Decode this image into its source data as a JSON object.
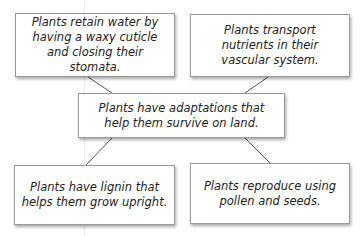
{
  "diagram": {
    "center": {
      "text": "Plants have adaptations that help them survive on land."
    },
    "nodes": [
      {
        "position": "top-left",
        "text": "Plants retain water by having a waxy cuticle and closing their stomata."
      },
      {
        "position": "top-right",
        "text": "Plants transport nutrients in their vascular system."
      },
      {
        "position": "bottom-left",
        "text": "Plants have lignin that helps them grow upright."
      },
      {
        "position": "bottom-right",
        "text": "Plants reproduce using pollen and seeds."
      }
    ]
  }
}
